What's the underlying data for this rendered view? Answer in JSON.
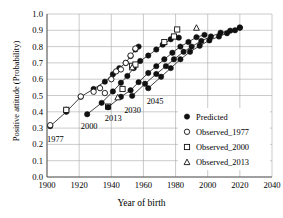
{
  "chart_data": {
    "type": "scatter",
    "title": "",
    "xlabel": "Year of birth",
    "ylabel": "Positive attitude (Probability)",
    "xlim": [
      1900,
      2040
    ],
    "ylim": [
      0.0,
      1.0
    ],
    "xticks": [
      "1900",
      "1920",
      "1940",
      "1960",
      "1980",
      "2000",
      "2020",
      "2040"
    ],
    "xtick_values": [
      1900,
      1920,
      1940,
      1960,
      1980,
      2000,
      2020,
      2040
    ],
    "yticks": [
      "0.0",
      "0.1",
      "0.2",
      "0.3",
      "0.4",
      "0.5",
      "0.6",
      "0.7",
      "0.8",
      "0.9",
      "1.0"
    ],
    "ytick_values": [
      0.0,
      0.1,
      0.2,
      0.3,
      0.4,
      0.5,
      0.6,
      0.7,
      0.8,
      0.9,
      1.0
    ],
    "grid": true,
    "legend_position": "bottom-right",
    "legend": [
      {
        "label": "Predicted",
        "marker": "filled-circle"
      },
      {
        "label": "Observed_1977",
        "marker": "open-circle"
      },
      {
        "label": "Observed_2000",
        "marker": "open-square"
      },
      {
        "label": "Observed_2013",
        "marker": "open-triangle"
      }
    ],
    "annotations": [
      {
        "text": "1977",
        "x": 1900,
        "y": 0.215
      },
      {
        "text": "2000",
        "x": 1921,
        "y": 0.295
      },
      {
        "text": "2013",
        "x": 1936,
        "y": 0.345
      },
      {
        "text": "2030",
        "x": 1948,
        "y": 0.395
      },
      {
        "text": "2045",
        "x": 1962,
        "y": 0.445
      }
    ],
    "series": [
      {
        "name": "Predicted_1977",
        "marker": "filled-circle",
        "line": true,
        "points": [
          {
            "x": 1902,
            "y": 0.312
          },
          {
            "x": 1912,
            "y": 0.4
          },
          {
            "x": 1921,
            "y": 0.492
          },
          {
            "x": 1929,
            "y": 0.54
          },
          {
            "x": 1936,
            "y": 0.585
          },
          {
            "x": 1941,
            "y": 0.63
          },
          {
            "x": 1945,
            "y": 0.668
          },
          {
            "x": 1949,
            "y": 0.7
          },
          {
            "x": 1952,
            "y": 0.742
          },
          {
            "x": 1955,
            "y": 0.782
          },
          {
            "x": 1957,
            "y": 0.8
          }
        ]
      },
      {
        "name": "Observed_1977",
        "marker": "open-circle",
        "line": false,
        "points": [
          {
            "x": 1902,
            "y": 0.318
          },
          {
            "x": 1912,
            "y": 0.412
          },
          {
            "x": 1921,
            "y": 0.494
          },
          {
            "x": 1929,
            "y": 0.523
          },
          {
            "x": 1933,
            "y": 0.545
          },
          {
            "x": 1936,
            "y": 0.515
          },
          {
            "x": 1940,
            "y": 0.6
          },
          {
            "x": 1943,
            "y": 0.648
          },
          {
            "x": 1946,
            "y": 0.66
          },
          {
            "x": 1949,
            "y": 0.7
          },
          {
            "x": 1952,
            "y": 0.745
          },
          {
            "x": 1955,
            "y": 0.788
          }
        ]
      },
      {
        "name": "Predicted_2000",
        "marker": "filled-circle",
        "line": true,
        "points": [
          {
            "x": 1925,
            "y": 0.385
          },
          {
            "x": 1934,
            "y": 0.455
          },
          {
            "x": 1941,
            "y": 0.525
          },
          {
            "x": 1946,
            "y": 0.578
          },
          {
            "x": 1950,
            "y": 0.62
          },
          {
            "x": 1954,
            "y": 0.668
          },
          {
            "x": 1958,
            "y": 0.712
          },
          {
            "x": 1963,
            "y": 0.745
          },
          {
            "x": 1968,
            "y": 0.782
          },
          {
            "x": 1972,
            "y": 0.812
          },
          {
            "x": 1977,
            "y": 0.845
          },
          {
            "x": 1982,
            "y": 0.855
          }
        ]
      },
      {
        "name": "Observed_2000",
        "marker": "open-square",
        "line": false,
        "points": [
          {
            "x": 1912,
            "y": 0.412
          },
          {
            "x": 1938,
            "y": 0.432
          },
          {
            "x": 1947,
            "y": 0.54
          },
          {
            "x": 1953,
            "y": 0.682
          },
          {
            "x": 1955,
            "y": 0.69
          },
          {
            "x": 1973,
            "y": 0.828
          },
          {
            "x": 1979,
            "y": 0.862
          },
          {
            "x": 1981,
            "y": 0.905
          }
        ]
      },
      {
        "name": "Predicted_2013",
        "marker": "filled-circle",
        "line": true,
        "points": [
          {
            "x": 1938,
            "y": 0.428
          },
          {
            "x": 1946,
            "y": 0.492
          },
          {
            "x": 1952,
            "y": 0.532
          },
          {
            "x": 1957,
            "y": 0.582
          },
          {
            "x": 1963,
            "y": 0.638
          },
          {
            "x": 1968,
            "y": 0.68
          },
          {
            "x": 1973,
            "y": 0.722
          },
          {
            "x": 1978,
            "y": 0.762
          },
          {
            "x": 1983,
            "y": 0.8
          },
          {
            "x": 1988,
            "y": 0.828
          },
          {
            "x": 1993,
            "y": 0.858
          },
          {
            "x": 1998,
            "y": 0.872
          }
        ]
      },
      {
        "name": "Observed_2013",
        "marker": "open-triangle",
        "line": false,
        "points": [
          {
            "x": 1944,
            "y": 0.488
          },
          {
            "x": 1953,
            "y": 0.672
          },
          {
            "x": 1993,
            "y": 0.915
          }
        ]
      },
      {
        "name": "Predicted_2030",
        "marker": "filled-circle",
        "line": true,
        "points": [
          {
            "x": 1953,
            "y": 0.498
          },
          {
            "x": 1961,
            "y": 0.572
          },
          {
            "x": 1968,
            "y": 0.632
          },
          {
            "x": 1974,
            "y": 0.68
          },
          {
            "x": 1979,
            "y": 0.722
          },
          {
            "x": 1985,
            "y": 0.768
          },
          {
            "x": 1990,
            "y": 0.8
          },
          {
            "x": 1996,
            "y": 0.835
          },
          {
            "x": 2002,
            "y": 0.862
          },
          {
            "x": 2008,
            "y": 0.885
          },
          {
            "x": 2014,
            "y": 0.898
          },
          {
            "x": 2020,
            "y": 0.918
          }
        ]
      },
      {
        "name": "Predicted_2045",
        "marker": "filled-circle",
        "line": true,
        "points": [
          {
            "x": 1963,
            "y": 0.545
          },
          {
            "x": 1971,
            "y": 0.615
          },
          {
            "x": 1977,
            "y": 0.668
          },
          {
            "x": 1983,
            "y": 0.722
          },
          {
            "x": 1989,
            "y": 0.768
          },
          {
            "x": 1995,
            "y": 0.805
          },
          {
            "x": 2001,
            "y": 0.838
          },
          {
            "x": 2007,
            "y": 0.862
          },
          {
            "x": 2012,
            "y": 0.882
          },
          {
            "x": 2017,
            "y": 0.9
          },
          {
            "x": 2020,
            "y": 0.915
          }
        ]
      }
    ]
  }
}
